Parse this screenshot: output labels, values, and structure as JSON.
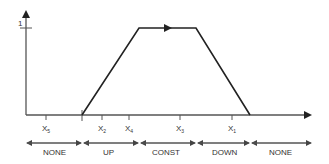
{
  "diagram": {
    "title": "",
    "y_axis": {
      "tick_label": "1"
    },
    "x_ticks": [
      {
        "name": "X",
        "sub": "5",
        "x": 46
      },
      {
        "name": "X",
        "sub": "2",
        "x": 102
      },
      {
        "name": "X",
        "sub": "4",
        "x": 129
      },
      {
        "name": "X",
        "sub": "3",
        "x": 180
      },
      {
        "name": "X",
        "sub": "1",
        "x": 232
      }
    ],
    "profile": {
      "shape": "trapezoid",
      "points": [
        [
          82,
          115
        ],
        [
          139,
          28
        ],
        [
          196,
          28
        ],
        [
          250,
          115
        ]
      ],
      "direction": "left-to-right"
    },
    "segments": [
      {
        "label": "NONE",
        "from": 26,
        "to": 82
      },
      {
        "label": "UP",
        "from": 82,
        "to": 139
      },
      {
        "label": "CONST",
        "from": 139,
        "to": 196
      },
      {
        "label": "DOWN",
        "from": 196,
        "to": 250
      },
      {
        "label": "NONE",
        "from": 250,
        "to": 312
      }
    ],
    "colors": {
      "line": "#2b2b2b",
      "axis": "#555555"
    }
  }
}
